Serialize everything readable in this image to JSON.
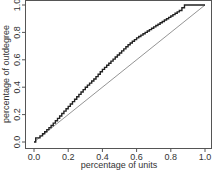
{
  "chart_data": {
    "type": "line",
    "title": "",
    "xlabel": "percentage of units",
    "ylabel": "percentage of outdegree",
    "xlim": [
      0,
      1
    ],
    "ylim": [
      0,
      1
    ],
    "grid": false,
    "legend": null,
    "x_ticks": [
      "0.0",
      "0.2",
      "0.4",
      "0.6",
      "0.8",
      "1.0"
    ],
    "y_ticks": [
      "0.0",
      "0.2",
      "0.4",
      "0.6",
      "0.8",
      "1.0"
    ],
    "series": [
      {
        "name": "cumulative outdegree (Lorenz curve)",
        "style": "step",
        "color": "#222222",
        "x": [
          0.0,
          0.01,
          0.02,
          0.05,
          0.1,
          0.15,
          0.2,
          0.25,
          0.3,
          0.35,
          0.4,
          0.45,
          0.5,
          0.55,
          0.6,
          0.65,
          0.7,
          0.75,
          0.8,
          0.85,
          0.88,
          0.9,
          1.0
        ],
        "y": [
          0.0,
          0.03,
          0.03,
          0.06,
          0.12,
          0.19,
          0.26,
          0.33,
          0.4,
          0.46,
          0.53,
          0.59,
          0.65,
          0.71,
          0.76,
          0.8,
          0.84,
          0.88,
          0.92,
          0.96,
          1.0,
          1.0,
          1.0
        ]
      },
      {
        "name": "line of equality",
        "style": "line",
        "color": "#888888",
        "x": [
          0.0,
          1.0
        ],
        "y": [
          0.0,
          1.0
        ]
      }
    ]
  }
}
